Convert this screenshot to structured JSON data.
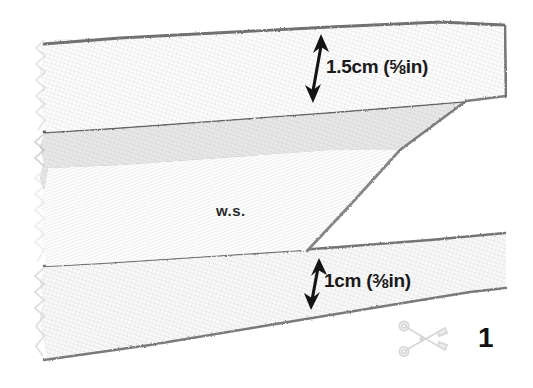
{
  "illustration": {
    "title": "Folded fabric strip with seam allowance dimensions",
    "wrong_side_label": "w.s.",
    "step_number": "1",
    "scissors_icon": "scissors-icon",
    "dimensions": [
      {
        "id": "top",
        "label": "1.5cm (⅝in)",
        "metric": "1.5cm",
        "imperial_open": "(",
        "imperial_num": "5",
        "imperial_den": "8",
        "imperial_unit": "in",
        "imperial_close": ")",
        "arrow": "double-headed-vertical-arrow"
      },
      {
        "id": "bottom",
        "label": "1cm (⅜in)",
        "metric": "1cm",
        "imperial_open": "(",
        "imperial_num": "3",
        "imperial_den": "8",
        "imperial_unit": "in",
        "imperial_close": ")",
        "arrow": "double-headed-vertical-arrow"
      }
    ],
    "colors": {
      "background": "#ffffff",
      "band_top_flap": "#dcdcdc",
      "band_dark": "#a3a3a3",
      "band_wrong_side": "#f2f2f0",
      "band_bottom": "#c6c6c6",
      "pencil_edge": "#6f6f6f",
      "ink": "#1a1a1a"
    }
  }
}
